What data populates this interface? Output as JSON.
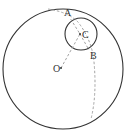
{
  "diagram": {
    "type": "geometry",
    "points": {
      "A": {
        "label": "A",
        "x": 67,
        "y": 15
      },
      "B": {
        "label": "B",
        "x": 90,
        "y": 52
      },
      "C": {
        "label": "C",
        "x": 80,
        "y": 34
      },
      "O": {
        "label": "O",
        "x": 60,
        "y": 68
      }
    },
    "circles": [
      {
        "name": "big-circle",
        "cx": 63,
        "cy": 69,
        "r": 61,
        "style": "solid"
      },
      {
        "name": "small-circle",
        "cx": 81,
        "cy": 35,
        "r": 16,
        "style": "solid"
      }
    ],
    "colors": {
      "stroke": "#333333",
      "dashed": "#999999"
    }
  }
}
